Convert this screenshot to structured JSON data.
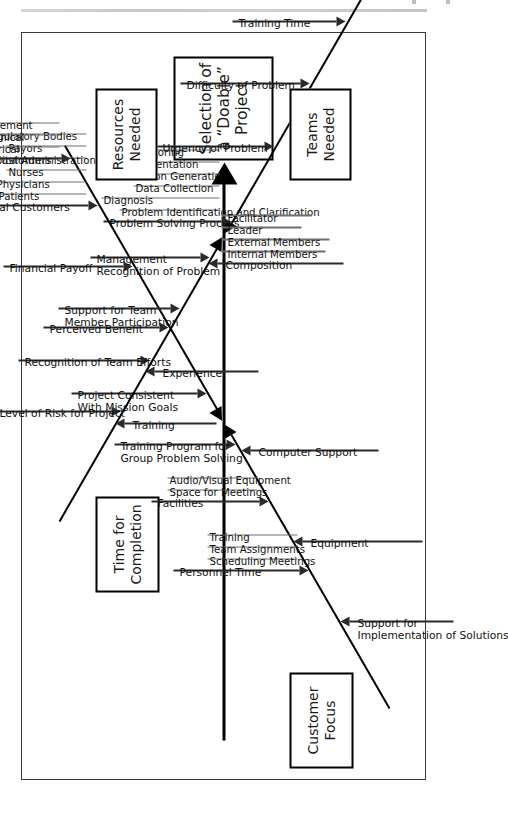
{
  "figure": {
    "type": "fishbone-ishikawa-diagram",
    "orientation": "rotated-90-ccw",
    "effect": "Selection of\na “Doable”\nProject"
  },
  "categories": [
    {
      "id": "time-for-completion",
      "label": "Time for\nCompletion",
      "side": "upper",
      "causes": [
        {
          "label": "Problem Solving Process",
          "subs": [
            "Problem Identification and Clarification",
            "Diagnosis",
            "Data Collection",
            "Solution Generation",
            "Implementation",
            "Monitoring"
          ]
        },
        {
          "label": "Urgency of Problem",
          "subs": []
        },
        {
          "label": "Difficulty of Problem",
          "subs": []
        },
        {
          "label": "Training Time",
          "subs": []
        }
      ]
    },
    {
      "id": "customer-focus",
      "label": "Customer\nFocus",
      "side": "lower",
      "causes": [
        {
          "label": "Project Consistent\nWith Mission Goals",
          "subs": []
        },
        {
          "label": "Perceived Benefit",
          "subs": []
        },
        {
          "label": "Financial Payoff",
          "subs": []
        },
        {
          "label": "External Customers",
          "subs": [
            "Patients",
            "Physicians",
            "Nurses",
            "Hospital Administration",
            "Payors",
            "Regulatory Bodies"
          ]
        },
        {
          "label": "Internal Customers",
          "subs": [
            "Clerical",
            "Technical",
            "Management"
          ]
        }
      ]
    },
    {
      "id": "teams-needed",
      "label": "Teams\nNeeded",
      "side": "upper",
      "causes": [
        {
          "label": "Management\nRecognition of Problem",
          "subs": []
        },
        {
          "label": "Support for Team\nMember Participation",
          "subs": []
        },
        {
          "label": "Recognition of Team Efforts",
          "subs": []
        },
        {
          "label": "Level of Risk for Project",
          "subs": []
        },
        {
          "label": "Composition",
          "subs": [
            "Internal Members",
            "External Members",
            "Leader",
            "Facilitator"
          ]
        },
        {
          "label": "Experience",
          "subs": []
        },
        {
          "label": "Training",
          "subs": []
        }
      ]
    },
    {
      "id": "resources-needed",
      "label": "Resources\nNeeded",
      "side": "lower",
      "causes": [
        {
          "label": "Training Program for\nGroup Problem Solving",
          "subs": []
        },
        {
          "label": "Facilities",
          "subs": [
            "Space for Meetings",
            "Audio/Visual Equipment"
          ]
        },
        {
          "label": "Personnel Time",
          "subs": [
            "Scheduling Meetings",
            "Team Assignments",
            "Training"
          ]
        },
        {
          "label": "Computer Support",
          "subs": []
        },
        {
          "label": "Equipment",
          "subs": []
        },
        {
          "label": "Support for\nImplementation of Solutions",
          "subs": []
        }
      ]
    }
  ],
  "colors": {
    "ink": "#000000",
    "sub_ink": "#6f6f6f",
    "frame": "#3a3a3a",
    "paper": "#ffffff"
  }
}
